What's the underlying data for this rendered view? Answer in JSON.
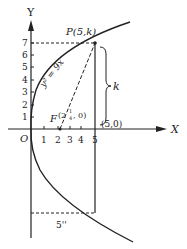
{
  "diagram": {
    "type": "parabola",
    "equation": "y² = 9x",
    "axes": {
      "x_label": "X",
      "y_label": "Y",
      "origin_label": "O",
      "x_ticks": [
        "1",
        "2",
        "3",
        "4",
        "5"
      ],
      "y_ticks": [
        "1",
        "2",
        "3",
        "4",
        "5",
        "6",
        "7"
      ]
    },
    "points": {
      "P": "P(5,k)",
      "F_prefix": "F",
      "F_coords": "(2",
      "F_frac_num": "1",
      "F_frac_den": "4",
      "F_rest": ", 0)",
      "base": "(5,0)"
    },
    "brace_label": "k",
    "bottom_label": "5''",
    "colors": {
      "ink": "#222222",
      "background": "#ffffff"
    }
  }
}
